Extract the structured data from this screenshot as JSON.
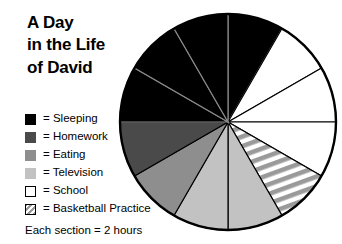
{
  "title": {
    "line1": "A Day",
    "line2": "in the Life",
    "line3": "of David"
  },
  "legend": {
    "items": [
      {
        "label": "= Sleeping",
        "swatch": "black",
        "color": "#000000",
        "icon": "legend-swatch-icon"
      },
      {
        "label": "= Homework",
        "swatch": "darkgray",
        "color": "#4a4a4a",
        "icon": "legend-swatch-icon"
      },
      {
        "label": "= Eating",
        "swatch": "medgray",
        "color": "#8e8e8e",
        "icon": "legend-swatch-icon"
      },
      {
        "label": "= Television",
        "swatch": "lightgray",
        "color": "#c2c2c2",
        "icon": "legend-swatch-icon"
      },
      {
        "label": "= School",
        "swatch": "white",
        "color": "#ffffff",
        "icon": "legend-swatch-icon"
      },
      {
        "label": "= Basketball Practice",
        "swatch": "striped",
        "color": "#9a9a9a",
        "icon": "legend-swatch-hatched-icon"
      }
    ]
  },
  "footnote": "Each section = 2 hours",
  "chart_data": {
    "type": "pie",
    "title": "A Day in the Life of David",
    "unit_note": "Each section = 2 hours",
    "total_sections": 12,
    "section_hours": 2,
    "total_hours": 24,
    "start_angle_deg": 0,
    "direction": "clockwise",
    "legend_position": "left",
    "grid": false,
    "categories": [
      "Sleeping",
      "Homework",
      "Eating",
      "Television",
      "School",
      "Basketball Practice"
    ],
    "values_sections": [
      4,
      1,
      1,
      2,
      3,
      1
    ],
    "values_hours": [
      8,
      2,
      2,
      4,
      6,
      2
    ],
    "values_percent": [
      33.3,
      8.3,
      8.3,
      16.7,
      25.0,
      8.3
    ],
    "colors": [
      "#000000",
      "#4a4a4a",
      "#8e8e8e",
      "#c2c2c2",
      "#ffffff",
      "#9a9a9a"
    ],
    "sectors": [
      {
        "index": 1,
        "category": "Sleeping",
        "start_deg": 0,
        "end_deg": 30,
        "fill": "#000000",
        "hatched": false
      },
      {
        "index": 2,
        "category": "School",
        "start_deg": 30,
        "end_deg": 60,
        "fill": "#ffffff",
        "hatched": false
      },
      {
        "index": 3,
        "category": "School",
        "start_deg": 60,
        "end_deg": 90,
        "fill": "#ffffff",
        "hatched": false
      },
      {
        "index": 4,
        "category": "School",
        "start_deg": 90,
        "end_deg": 120,
        "fill": "#ffffff",
        "hatched": false
      },
      {
        "index": 5,
        "category": "Basketball Practice",
        "start_deg": 120,
        "end_deg": 150,
        "fill": "#9a9a9a",
        "hatched": true
      },
      {
        "index": 6,
        "category": "Television",
        "start_deg": 150,
        "end_deg": 180,
        "fill": "#c2c2c2",
        "hatched": false
      },
      {
        "index": 7,
        "category": "Television",
        "start_deg": 180,
        "end_deg": 210,
        "fill": "#c2c2c2",
        "hatched": false
      },
      {
        "index": 8,
        "category": "Eating",
        "start_deg": 210,
        "end_deg": 240,
        "fill": "#8e8e8e",
        "hatched": false
      },
      {
        "index": 9,
        "category": "Homework",
        "start_deg": 240,
        "end_deg": 270,
        "fill": "#4a4a4a",
        "hatched": false
      },
      {
        "index": 10,
        "category": "Sleeping",
        "start_deg": 270,
        "end_deg": 300,
        "fill": "#000000",
        "hatched": false
      },
      {
        "index": 11,
        "category": "Sleeping",
        "start_deg": 300,
        "end_deg": 330,
        "fill": "#000000",
        "hatched": false
      },
      {
        "index": 12,
        "category": "Sleeping",
        "start_deg": 330,
        "end_deg": 360,
        "fill": "#000000",
        "hatched": false
      }
    ]
  }
}
